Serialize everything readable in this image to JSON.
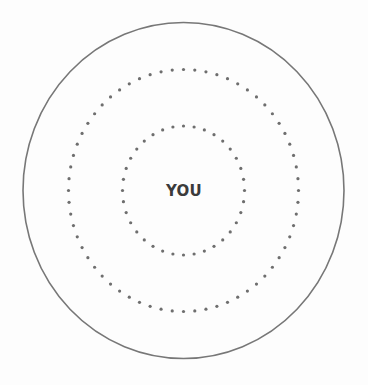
{
  "diagram": {
    "center_label": "YOU",
    "colors": {
      "background": "#fdfdfd",
      "outer_stroke": "#777777",
      "dots": "#6e6e6e",
      "label": "#3b3b3b"
    },
    "center": {
      "x": 183.5,
      "y": 190.5
    },
    "outer_ring": {
      "style": "solid",
      "rx": 160.5,
      "ry": 168,
      "stroke_width": 1.6
    },
    "middle_ring": {
      "style": "dotted",
      "rx": 115,
      "ry": 121,
      "dot_count": 64,
      "dot_radius": 1.6
    },
    "inner_ring": {
      "style": "dotted",
      "rx": 61,
      "ry": 64.5,
      "dot_count": 36,
      "dot_radius": 1.6
    }
  }
}
